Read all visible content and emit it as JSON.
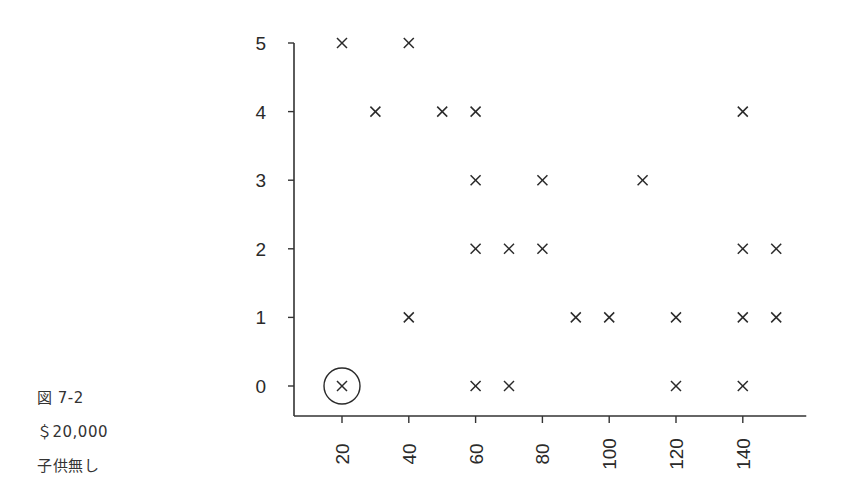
{
  "captions": {
    "figure": "図 7-2",
    "amount": "＄20,000",
    "condition": "子供無し"
  },
  "chart_data": {
    "type": "scatter",
    "title": "",
    "xlabel": "",
    "ylabel": "",
    "marker": "x",
    "xlim": [
      6,
      159
    ],
    "ylim": [
      -0.45,
      5
    ],
    "x_ticks": [
      20,
      40,
      60,
      80,
      100,
      120,
      140
    ],
    "y_ticks": [
      0,
      1,
      2,
      3,
      4,
      5
    ],
    "x_tick_rotation": -90,
    "grid": false,
    "points": [
      {
        "x": 20,
        "y": 5
      },
      {
        "x": 40,
        "y": 5
      },
      {
        "x": 30,
        "y": 4
      },
      {
        "x": 50,
        "y": 4
      },
      {
        "x": 60,
        "y": 4
      },
      {
        "x": 140,
        "y": 4
      },
      {
        "x": 60,
        "y": 3
      },
      {
        "x": 80,
        "y": 3
      },
      {
        "x": 110,
        "y": 3
      },
      {
        "x": 60,
        "y": 2
      },
      {
        "x": 70,
        "y": 2
      },
      {
        "x": 80,
        "y": 2
      },
      {
        "x": 140,
        "y": 2
      },
      {
        "x": 150,
        "y": 2
      },
      {
        "x": 40,
        "y": 1
      },
      {
        "x": 90,
        "y": 1
      },
      {
        "x": 100,
        "y": 1
      },
      {
        "x": 120,
        "y": 1
      },
      {
        "x": 140,
        "y": 1
      },
      {
        "x": 150,
        "y": 1
      },
      {
        "x": 20,
        "y": 0
      },
      {
        "x": 60,
        "y": 0
      },
      {
        "x": 70,
        "y": 0
      },
      {
        "x": 120,
        "y": 0
      },
      {
        "x": 140,
        "y": 0
      }
    ],
    "annotations": [
      {
        "type": "circle",
        "x": 20,
        "y": 0,
        "note": "highlighted point"
      }
    ]
  },
  "style": {
    "axis_color": "#333333",
    "marker_color": "#2a2a2a"
  }
}
